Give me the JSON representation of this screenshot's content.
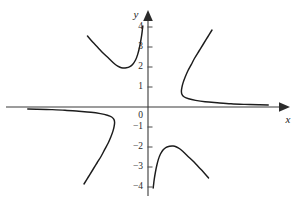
{
  "figure": {
    "kind": "cartesian-graph",
    "background_color": "#ffffff",
    "curve_color": "#1c1c1c",
    "axis_color": "#3a3a3a"
  },
  "axes": {
    "x_axis_label": "x",
    "y_axis_label": "y",
    "origin_label": "0",
    "x_tick_labels": [],
    "y_tick_labels": [
      "4",
      "3",
      "2",
      "1",
      "0",
      "−1",
      "−2",
      "−3",
      "−4"
    ]
  },
  "chart_data": {
    "type": "line",
    "title": "",
    "xlabel": "x",
    "ylabel": "y",
    "grid": false,
    "legend": "none",
    "xlim": [
      -7.4,
      7.5
    ],
    "ylim": [
      -4.4,
      4.4
    ],
    "x_ticks": [],
    "y_ticks": [
      4,
      3,
      2,
      1,
      0,
      -1,
      -2,
      -3,
      -4
    ],
    "y_tick_labels": [
      "4",
      "3",
      "2",
      "1",
      "0",
      "−1",
      "−2",
      "−3",
      "−4"
    ],
    "series": [
      {
        "name": "upper-left-branch",
        "comment": "descends from upper left to a minimum near (-1.6, 1.95) then rises steeply toward the y-axis",
        "points": [
          [
            -3.5,
            3.55
          ],
          [
            -3.2,
            3.25
          ],
          [
            -2.9,
            2.98
          ],
          [
            -2.6,
            2.7
          ],
          [
            -2.3,
            2.46
          ],
          [
            -2.05,
            2.25
          ],
          [
            -1.85,
            2.1
          ],
          [
            -1.65,
            2.0
          ],
          [
            -1.45,
            1.95
          ],
          [
            -1.25,
            1.96
          ],
          [
            -1.05,
            2.02
          ],
          [
            -0.88,
            2.14
          ],
          [
            -0.72,
            2.35
          ],
          [
            -0.6,
            2.62
          ],
          [
            -0.5,
            2.95
          ],
          [
            -0.42,
            3.3
          ],
          [
            -0.36,
            3.62
          ],
          [
            -0.32,
            3.9
          ],
          [
            -0.3,
            4.05
          ]
        ]
      },
      {
        "name": "upper-right-branch",
        "comment": "comes down from upper right, bends left to a leftmost vertex near (1.95, 0.75), then flattens rightward approaching the x-axis",
        "points": [
          [
            3.7,
            3.85
          ],
          [
            3.45,
            3.5
          ],
          [
            3.2,
            3.15
          ],
          [
            2.95,
            2.8
          ],
          [
            2.7,
            2.45
          ],
          [
            2.5,
            2.12
          ],
          [
            2.3,
            1.8
          ],
          [
            2.15,
            1.5
          ],
          [
            2.03,
            1.22
          ],
          [
            1.96,
            0.98
          ],
          [
            1.93,
            0.78
          ],
          [
            1.97,
            0.62
          ],
          [
            2.1,
            0.5
          ],
          [
            2.35,
            0.41
          ],
          [
            2.75,
            0.33
          ],
          [
            3.3,
            0.26
          ],
          [
            4.0,
            0.21
          ],
          [
            4.8,
            0.16
          ],
          [
            5.6,
            0.13
          ],
          [
            6.4,
            0.11
          ],
          [
            6.95,
            0.1
          ]
        ]
      },
      {
        "name": "lower-left-branch",
        "comment": "180-degree rotation of the upper-right branch; runs just below the x-axis from the far left to a rightmost vertex near (-1.95, -0.75) then drops to lower left",
        "points": [
          [
            -6.95,
            -0.1
          ],
          [
            -6.4,
            -0.11
          ],
          [
            -5.6,
            -0.13
          ],
          [
            -4.8,
            -0.16
          ],
          [
            -4.0,
            -0.21
          ],
          [
            -3.3,
            -0.26
          ],
          [
            -2.75,
            -0.33
          ],
          [
            -2.35,
            -0.41
          ],
          [
            -2.1,
            -0.5
          ],
          [
            -1.97,
            -0.62
          ],
          [
            -1.93,
            -0.78
          ],
          [
            -1.96,
            -0.98
          ],
          [
            -2.03,
            -1.22
          ],
          [
            -2.15,
            -1.5
          ],
          [
            -2.3,
            -1.8
          ],
          [
            -2.5,
            -2.12
          ],
          [
            -2.7,
            -2.45
          ],
          [
            -2.95,
            -2.8
          ],
          [
            -3.2,
            -3.15
          ],
          [
            -3.45,
            -3.5
          ],
          [
            -3.7,
            -3.85
          ]
        ]
      },
      {
        "name": "lower-middle-branch",
        "comment": "180-degree rotation of the upper-left branch; rises steeply from near the y-axis to a maximum near (1.6, -1.95) then descends to the lower right",
        "points": [
          [
            0.3,
            -4.05
          ],
          [
            0.32,
            -3.9
          ],
          [
            0.36,
            -3.62
          ],
          [
            0.42,
            -3.3
          ],
          [
            0.5,
            -2.95
          ],
          [
            0.6,
            -2.62
          ],
          [
            0.72,
            -2.35
          ],
          [
            0.88,
            -2.14
          ],
          [
            1.05,
            -2.02
          ],
          [
            1.25,
            -1.96
          ],
          [
            1.45,
            -1.95
          ],
          [
            1.65,
            -2.0
          ],
          [
            1.85,
            -2.1
          ],
          [
            2.05,
            -2.25
          ],
          [
            2.3,
            -2.46
          ],
          [
            2.6,
            -2.7
          ],
          [
            2.9,
            -2.98
          ],
          [
            3.2,
            -3.25
          ],
          [
            3.5,
            -3.55
          ]
        ]
      }
    ]
  }
}
